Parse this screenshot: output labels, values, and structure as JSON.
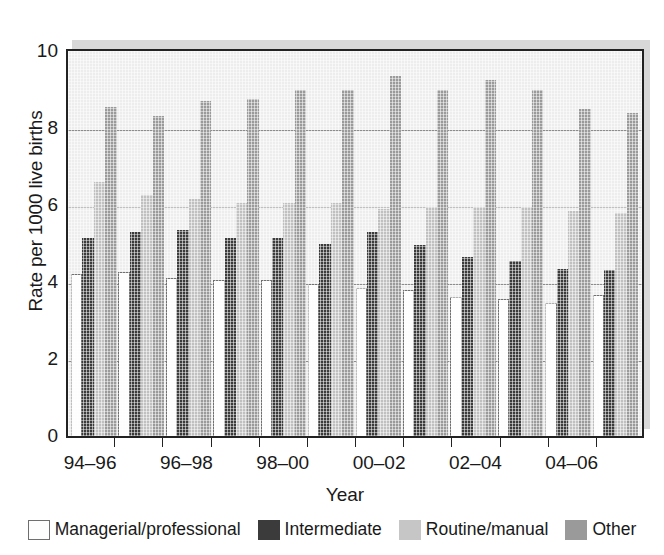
{
  "chart_data": {
    "type": "bar",
    "title": "",
    "xlabel": "Year",
    "ylabel": "Rate per 1000 live births",
    "ylim": [
      0,
      10
    ],
    "yticks": [
      0,
      2,
      4,
      6,
      8,
      10
    ],
    "ytick_labels": [
      "0",
      "2",
      "4",
      "6",
      "8",
      "10"
    ],
    "grid": true,
    "grid_axis": "y",
    "legend_position": "bottom",
    "categories": [
      "94–96",
      "95–97",
      "96–98",
      "97–99",
      "98–00",
      "99–01",
      "00–02",
      "01–03",
      "02–04",
      "03–05",
      "04–06",
      "05–07"
    ],
    "xtick_labels": [
      "94–96",
      "96–98",
      "98–00",
      "00–02",
      "02–04",
      "04–06"
    ],
    "xtick_label_positions": [
      0,
      2,
      4,
      6,
      8,
      10
    ],
    "series": [
      {
        "name": "Managerial/professional",
        "color": "#fdfdfd",
        "values": [
          4.2,
          4.25,
          4.1,
          4.05,
          4.05,
          3.95,
          3.85,
          3.8,
          3.6,
          3.55,
          3.45,
          3.65
        ]
      },
      {
        "name": "Intermediate",
        "color": "#3b3b3b",
        "values": [
          5.15,
          5.3,
          5.35,
          5.15,
          5.15,
          5.0,
          5.3,
          4.95,
          4.65,
          4.55,
          4.35,
          4.3
        ]
      },
      {
        "name": "Routine/manual",
        "color": "#c0c0c0",
        "values": [
          6.6,
          6.25,
          6.15,
          6.05,
          6.05,
          6.05,
          5.9,
          5.95,
          5.95,
          5.95,
          5.85,
          5.8
        ]
      },
      {
        "name": "Other",
        "color": "#9a9a9a",
        "values": [
          8.55,
          8.3,
          8.7,
          8.75,
          9.0,
          9.0,
          9.35,
          9.0,
          9.25,
          9.0,
          8.5,
          8.4
        ]
      }
    ]
  },
  "legend": {
    "items": [
      {
        "label": "Managerial/professional",
        "key": "managerial"
      },
      {
        "label": "Intermediate",
        "key": "intermediate"
      },
      {
        "label": "Routine/manual",
        "key": "routine"
      },
      {
        "label": "Other",
        "key": "other"
      }
    ]
  }
}
